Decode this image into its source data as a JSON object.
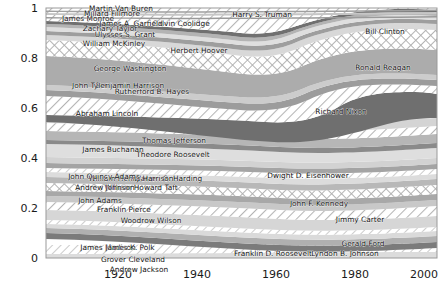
{
  "chart_data": {
    "type": "area",
    "title": "",
    "subtitle": "",
    "xlabel": "",
    "ylabel": "",
    "xlim": [
      1908,
      2008
    ],
    "ylim": [
      0,
      1
    ],
    "grid": false,
    "legend": "none",
    "stacked": true,
    "normalized": true,
    "x_ticks": [
      1920,
      1940,
      1960,
      1980,
      2000
    ],
    "y_ticks": [
      "0",
      "0.2",
      "0.4",
      "0.6",
      "0.8",
      "1"
    ],
    "note": "Grayscale normalized streamgraph of U.S. Presidents; each band is one president, labelled in place.",
    "series": [
      {
        "name": "Andrew Jackson",
        "label_x": 139,
        "label_y": 272,
        "fill": "solid-light",
        "anchor": "middle"
      },
      {
        "name": "Grover Cleveland",
        "label_x": 133,
        "label_y": 262,
        "fill": "hatch-light",
        "anchor": "middle"
      },
      {
        "name": "James Madison",
        "label_x": 108,
        "label_y": 250,
        "fill": "solid-mid",
        "anchor": "middle"
      },
      {
        "name": "James K. Polk",
        "label_x": 130,
        "label_y": 250,
        "fill": "solid-light",
        "anchor": "middle"
      },
      {
        "name": "Franklin D. Roosevelt",
        "label_x": 273,
        "label_y": 256,
        "fill": "solid-dark",
        "anchor": "middle"
      },
      {
        "name": "Lyndon B. Johnson",
        "label_x": 345,
        "label_y": 256,
        "fill": "solid-mid",
        "anchor": "middle"
      },
      {
        "name": "Gerald Ford",
        "label_x": 363,
        "label_y": 246,
        "fill": "hatch-light",
        "anchor": "middle"
      },
      {
        "name": "Jimmy Carter",
        "label_x": 360,
        "label_y": 222,
        "fill": "hatch-light",
        "anchor": "middle"
      },
      {
        "name": "Woodrow Wilson",
        "label_x": 151,
        "label_y": 223,
        "fill": "solid-light",
        "anchor": "middle"
      },
      {
        "name": "Franklin Pierce",
        "label_x": 124,
        "label_y": 212,
        "fill": "hatch-light",
        "anchor": "middle"
      },
      {
        "name": "John Adams",
        "label_x": 100,
        "label_y": 203,
        "fill": "solid-mid",
        "anchor": "middle"
      },
      {
        "name": "John F. Kennedy",
        "label_x": 319,
        "label_y": 206,
        "fill": "crosshatch",
        "anchor": "middle"
      },
      {
        "name": "William Howard Taft",
        "label_x": 141,
        "label_y": 190,
        "fill": "solid-mid",
        "anchor": "middle"
      },
      {
        "name": "Andrew Johnson",
        "label_x": 105,
        "label_y": 190,
        "fill": "solid-light",
        "anchor": "middle"
      },
      {
        "name": "Warren G. Harding",
        "label_x": 168,
        "label_y": 181,
        "fill": "hatch-light",
        "anchor": "middle"
      },
      {
        "name": "William Henry Harrison",
        "label_x": 131,
        "label_y": 181,
        "fill": "solid-mid",
        "anchor": "middle"
      },
      {
        "name": "John Quincy Adams",
        "label_x": 104,
        "label_y": 179,
        "fill": "solid-light",
        "anchor": "middle"
      },
      {
        "name": "Dwight D. Eisenhower",
        "label_x": 308,
        "label_y": 178,
        "fill": "solid-light",
        "anchor": "middle"
      },
      {
        "name": "Theodore Roosevelt",
        "label_x": 173,
        "label_y": 157,
        "fill": "solid-mid",
        "anchor": "middle"
      },
      {
        "name": "James Buchanan",
        "label_x": 113,
        "label_y": 152,
        "fill": "hatch-light",
        "anchor": "middle"
      },
      {
        "name": "Thomas Jefferson",
        "label_x": 174,
        "label_y": 143,
        "fill": "solid-light",
        "anchor": "middle"
      },
      {
        "name": "Richard Nixon",
        "label_x": 341,
        "label_y": 114,
        "fill": "solid-dark",
        "anchor": "middle"
      },
      {
        "name": "Abraham Lincoln",
        "label_x": 107,
        "label_y": 116,
        "fill": "hatch-light",
        "anchor": "middle"
      },
      {
        "name": "Rutherford B. Hayes",
        "label_x": 152,
        "label_y": 94,
        "fill": "solid-mid",
        "anchor": "middle"
      },
      {
        "name": "Benjamin Harrison",
        "label_x": 130,
        "label_y": 88,
        "fill": "solid-light",
        "anchor": "middle"
      },
      {
        "name": "John Tyler",
        "label_x": 90,
        "label_y": 88,
        "fill": "solid-mid",
        "anchor": "middle"
      },
      {
        "name": "George Washington",
        "label_x": 130,
        "label_y": 71,
        "fill": "solid-mid",
        "anchor": "middle"
      },
      {
        "name": "Ronald Reagan",
        "label_x": 383,
        "label_y": 70,
        "fill": "crosshatch",
        "anchor": "middle"
      },
      {
        "name": "Herbert Hoover",
        "label_x": 199,
        "label_y": 53,
        "fill": "solid-light",
        "anchor": "middle"
      },
      {
        "name": "William McKinley",
        "label_x": 114,
        "label_y": 46,
        "fill": "solid-mid",
        "anchor": "middle"
      },
      {
        "name": "Bill Clinton",
        "label_x": 385,
        "label_y": 34,
        "fill": "hatch-light",
        "anchor": "middle"
      },
      {
        "name": "Ulysses S. Grant",
        "label_x": 125,
        "label_y": 37,
        "fill": "solid-light",
        "anchor": "middle"
      },
      {
        "name": "Zachary Taylor",
        "label_x": 110,
        "label_y": 31,
        "fill": "solid-mid",
        "anchor": "middle"
      },
      {
        "name": "Calvin Coolidge",
        "label_x": 181,
        "label_y": 26,
        "fill": "hatch-light",
        "anchor": "middle"
      },
      {
        "name": "James A. Garfield",
        "label_x": 131,
        "label_y": 26,
        "fill": "solid-dark",
        "anchor": "middle"
      },
      {
        "name": "Harry S. Truman",
        "label_x": 262,
        "label_y": 17,
        "fill": "hatch-light",
        "anchor": "middle"
      },
      {
        "name": "James Monroe",
        "label_x": 88,
        "label_y": 21,
        "fill": "solid-mid",
        "anchor": "middle"
      },
      {
        "name": "Millard Fillmore",
        "label_x": 112,
        "label_y": 16,
        "fill": "solid-light",
        "anchor": "middle"
      },
      {
        "name": "Martin Van Buren",
        "label_x": 121,
        "label_y": 11,
        "fill": "solid-mid",
        "anchor": "middle"
      }
    ]
  },
  "axes": {
    "x_tick_labels": [
      "1920",
      "1940",
      "1960",
      "1980",
      "2000"
    ],
    "y_tick_labels": [
      "1",
      "0.8",
      "0.6",
      "0.4",
      "0.2",
      "0"
    ]
  },
  "colors": {
    "background": "#ffffff",
    "frame": "#9a9a9a",
    "text": "#1a1a1a",
    "solid_light": "#d8d8d8",
    "solid_mid": "#a9a9a9",
    "solid_dark": "#6d6d6d",
    "hatch_bg": "#ffffff",
    "hatch_line": "#b4b4b4",
    "cross_bg": "#ffffff",
    "cross_line": "#b0b0b0"
  }
}
